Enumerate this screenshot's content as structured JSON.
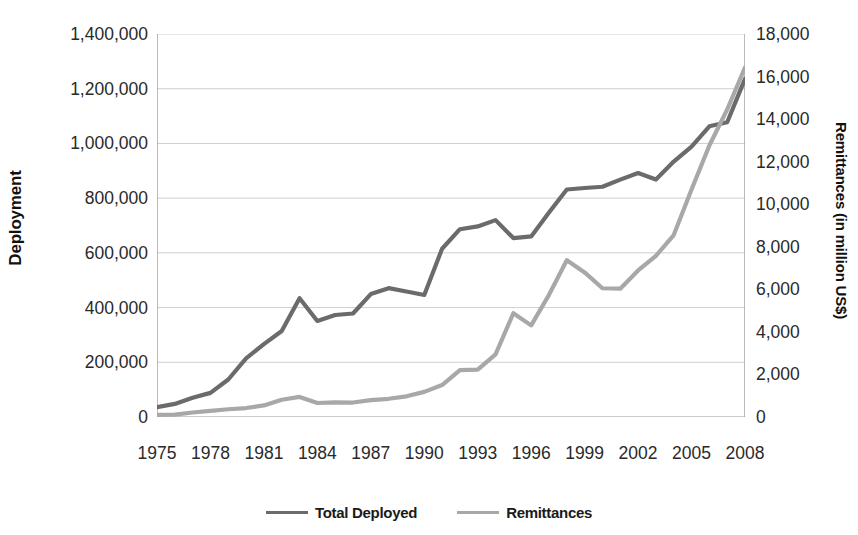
{
  "chart_data": {
    "type": "line",
    "title": "",
    "xlabel": "",
    "grid": true,
    "legend_position": "bottom",
    "x": [
      1975,
      1976,
      1977,
      1978,
      1979,
      1980,
      1981,
      1982,
      1983,
      1984,
      1985,
      1986,
      1987,
      1988,
      1989,
      1990,
      1991,
      1992,
      1993,
      1994,
      1995,
      1996,
      1997,
      1998,
      1999,
      2000,
      2001,
      2002,
      2003,
      2004,
      2005,
      2006,
      2007,
      2008
    ],
    "x_tick_labels": [
      "1975",
      "1978",
      "1981",
      "1984",
      "1987",
      "1990",
      "1993",
      "1996",
      "1999",
      "2002",
      "2005",
      "2008"
    ],
    "axes": {
      "left": {
        "label": "Deployment",
        "min": 0,
        "max": 1400000,
        "step": 200000,
        "ticks": [
          "0",
          "200,000",
          "400,000",
          "600,000",
          "800,000",
          "1,000,000",
          "1,200,000",
          "1,400,000"
        ]
      },
      "right": {
        "label": "Remittances (in million US$)",
        "min": 0,
        "max": 18000,
        "step": 2000,
        "ticks": [
          "0",
          "2,000",
          "4,000",
          "6,000",
          "8,000",
          "10,000",
          "12,000",
          "14,000",
          "16,000",
          "18,000"
        ]
      }
    },
    "series": [
      {
        "name": "Total Deployed",
        "axis": "left",
        "color": "#6b6b6b",
        "values": [
          36035,
          47835,
          70375,
          88235,
          137000,
          214590,
          266243,
          314284,
          434207,
          350982,
          372784,
          378214,
          449271,
          471030,
          458626,
          446095,
          615019,
          686461,
          696630,
          719602,
          654022,
          660122,
          747696,
          831643,
          837020,
          841628,
          867599,
          891908,
          867969,
          933588,
          988615,
          1062567,
          1077623,
          1236013
        ]
      },
      {
        "name": "Remittances",
        "axis": "right",
        "color": "#a8a8a8",
        "values": [
          103,
          111,
          213,
          291,
          364,
          421,
          546,
          811,
          944,
          658,
          687,
          680,
          791,
          856,
          973,
          1181,
          1500,
          2202,
          2230,
          2940,
          4878,
          4306,
          5742,
          7368,
          6795,
          6050,
          6031,
          6886,
          7578,
          8550,
          10689,
          12761,
          14450,
          16427
        ]
      }
    ]
  },
  "legend": {
    "items": [
      {
        "label": "Total Deployed",
        "color": "#6b6b6b"
      },
      {
        "label": "Remittances",
        "color": "#a8a8a8"
      }
    ]
  }
}
